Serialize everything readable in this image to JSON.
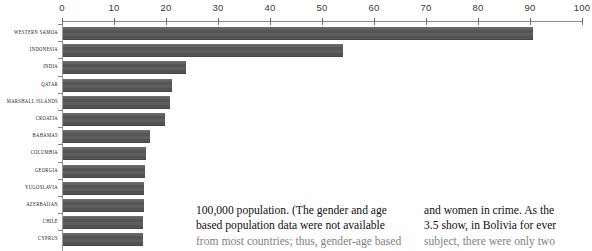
{
  "chart_data": {
    "type": "bar",
    "orientation": "horizontal",
    "title": "",
    "xlabel": "",
    "ylabel": "",
    "xlim": [
      0,
      100
    ],
    "xticks": [
      0,
      10,
      20,
      30,
      40,
      50,
      60,
      70,
      80,
      90,
      100
    ],
    "grid": false,
    "legend": null,
    "bar_color": "#5a5a5a",
    "axis_color": "#8d8d8d",
    "categories": [
      "WESTERN SAMOA",
      "INDONESIA",
      "INDIA",
      "QATAR",
      "MARSHALL ISLANDS",
      "CROATIA",
      "BAHAMAS",
      "COLUMBIA",
      "GEORGIA",
      "YUGOSLAVIA",
      "AZERBAIJAN",
      "CHILE",
      "CYPRUS"
    ],
    "values": [
      90.5,
      54.0,
      23.8,
      21.2,
      20.8,
      19.8,
      17.0,
      16.2,
      16.0,
      15.8,
      15.7,
      15.6,
      15.5
    ],
    "note": "bottom rows are cropped by the page edge"
  },
  "body_text": {
    "left_column": [
      "100,000 population. (The gender and age",
      "based population data were not available",
      "from most countries; thus, gender-age based"
    ],
    "right_column": [
      "and women in crime. As the",
      "3.5 show, in Bolivia for ever",
      "subject, there were only two"
    ]
  }
}
